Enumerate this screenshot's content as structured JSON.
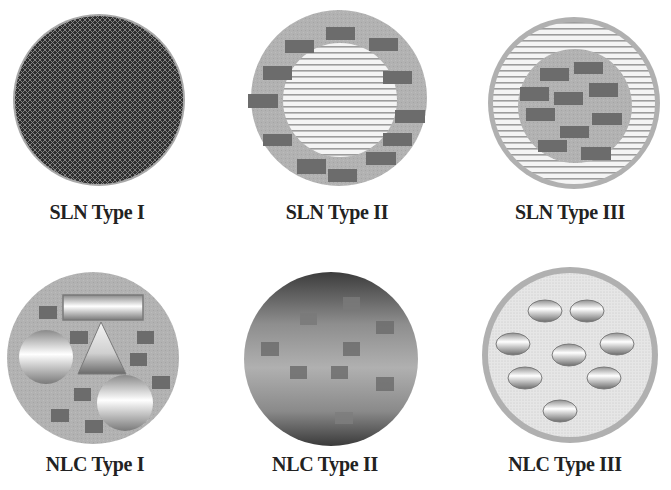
{
  "figure": {
    "colors": {
      "background": "#ffffff",
      "shell_grey": "#b4b4b4",
      "dark_drug": "#6e6e6e",
      "solid_core_dark": "#3c3c3c",
      "stripe_light": "#f2f2f2",
      "stripe_dark": "#9a9a9a",
      "dotted_light": "#e0e0e0"
    },
    "panels": [
      {
        "id": "sln-type-1",
        "label": "SLN Type I",
        "description": "Homogeneous matrix model - drug molecularly dispersed in solid lipid"
      },
      {
        "id": "sln-type-2",
        "label": "SLN Type II",
        "description": "Drug-enriched shell model - lipid core with drug-enriched outer shell"
      },
      {
        "id": "sln-type-3",
        "label": "SLN Type III",
        "description": "Drug-enriched core model - drug-rich core surrounded by lipid shell"
      },
      {
        "id": "nlc-type-1",
        "label": "NLC Type I",
        "description": "Imperfect crystal type - irregular solid and liquid lipid domains"
      },
      {
        "id": "nlc-type-2",
        "label": "NLC Type II",
        "description": "Amorphous type - structureless lipid matrix"
      },
      {
        "id": "nlc-type-3",
        "label": "NLC Type III",
        "description": "Multiple type - oil nanocompartments within solid lipid"
      }
    ]
  }
}
